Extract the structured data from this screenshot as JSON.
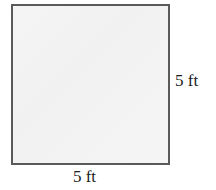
{
  "figure": {
    "type": "square-diagram",
    "shape_name": "square",
    "fill_color": "#f3f3f3",
    "stroke_color": "#5a5a5a",
    "background_color": "#ffffff",
    "labels": {
      "right": "5 ft",
      "bottom": "5 ft"
    },
    "dimensions": {
      "side_value": "5",
      "units": "ft"
    }
  }
}
